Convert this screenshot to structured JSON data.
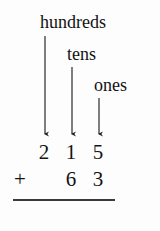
{
  "worksheet": {
    "type": "place-value-addition",
    "background_color": "#fdfdfd",
    "ink_color": "#141414",
    "labels": {
      "hundreds": "hundreds",
      "tens": "tens",
      "ones": "ones"
    },
    "arrows": [
      {
        "name": "hundreds-arrow",
        "x": 45,
        "y_start": 36,
        "y_end": 138
      },
      {
        "name": "tens-arrow",
        "x": 72,
        "y_start": 67,
        "y_end": 138
      },
      {
        "name": "ones-arrow",
        "x": 99,
        "y_start": 98,
        "y_end": 138
      }
    ],
    "addition": {
      "operator": "+",
      "addend_1": {
        "value": "215",
        "hundreds": "2",
        "tens": "1",
        "ones": "5"
      },
      "addend_2": {
        "value": "63",
        "hundreds": "",
        "tens": "6",
        "ones": "3"
      },
      "sum": "",
      "rule_visible": true
    }
  }
}
